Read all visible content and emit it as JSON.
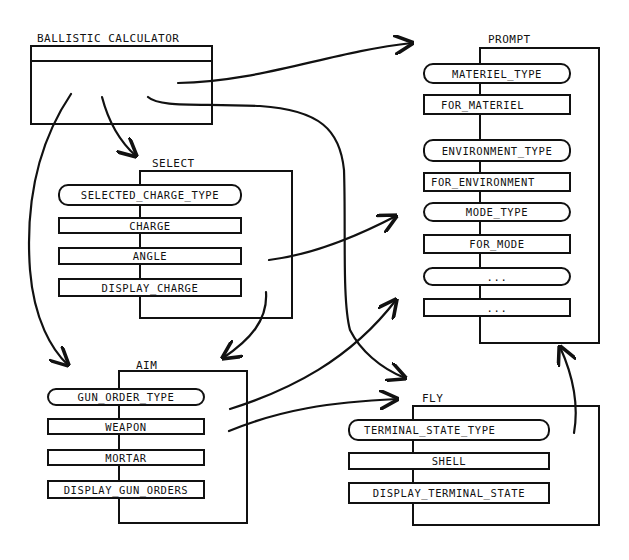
{
  "ballistic_calculator": {
    "title": "BALLISTIC CALCULATOR"
  },
  "prompt": {
    "title": "PROMPT",
    "items": [
      {
        "label": "MATERIEL_TYPE",
        "kind": "type"
      },
      {
        "label": "FOR_MATERIEL",
        "kind": "subprogram"
      },
      {
        "label": "ENVIRONMENT_TYPE",
        "kind": "type"
      },
      {
        "label": "FOR_ENVIRONMENT",
        "kind": "subprogram"
      },
      {
        "label": "MODE_TYPE",
        "kind": "type"
      },
      {
        "label": "FOR_MODE",
        "kind": "subprogram"
      },
      {
        "label": "...",
        "kind": "type"
      },
      {
        "label": "...",
        "kind": "subprogram"
      }
    ]
  },
  "select": {
    "title": "SELECT",
    "items": [
      {
        "label": "SELECTED_CHARGE_TYPE",
        "kind": "type"
      },
      {
        "label": "CHARGE",
        "kind": "subprogram"
      },
      {
        "label": "ANGLE",
        "kind": "subprogram"
      },
      {
        "label": "DISPLAY_CHARGE",
        "kind": "subprogram"
      }
    ]
  },
  "aim": {
    "title": "AIM",
    "items": [
      {
        "label": "GUN_ORDER_TYPE",
        "kind": "type"
      },
      {
        "label": "WEAPON",
        "kind": "subprogram"
      },
      {
        "label": "MORTAR",
        "kind": "subprogram"
      },
      {
        "label": "DISPLAY_GUN_ORDERS",
        "kind": "subprogram"
      }
    ]
  },
  "fly": {
    "title": "FLY",
    "items": [
      {
        "label": "TERMINAL_STATE_TYPE",
        "kind": "type"
      },
      {
        "label": "SHELL",
        "kind": "subprogram"
      },
      {
        "label": "DISPLAY_TERMINAL_STATE",
        "kind": "subprogram"
      }
    ]
  },
  "edges": [
    {
      "from": "BALLISTIC CALCULATOR",
      "to": "PROMPT"
    },
    {
      "from": "BALLISTIC CALCULATOR",
      "to": "SELECT"
    },
    {
      "from": "BALLISTIC CALCULATOR",
      "to": "AIM"
    },
    {
      "from": "BALLISTIC CALCULATOR",
      "to": "FLY"
    },
    {
      "from": "SELECT",
      "to": "PROMPT"
    },
    {
      "from": "SELECT",
      "to": "AIM"
    },
    {
      "from": "AIM",
      "to": "PROMPT"
    },
    {
      "from": "AIM",
      "to": "FLY"
    },
    {
      "from": "FLY",
      "to": "PROMPT"
    }
  ],
  "colors": {
    "ink": "#111111",
    "paper": "#ffffff"
  }
}
